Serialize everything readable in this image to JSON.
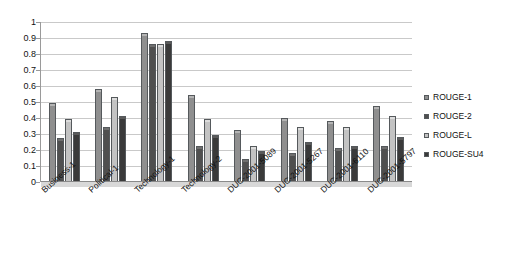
{
  "chart_data": {
    "type": "bar",
    "title": "",
    "subtitle": "",
    "xlabel": "",
    "ylabel": "",
    "ylim": [
      0,
      1
    ],
    "ytick_labels": [
      "1",
      "0.9",
      "0.8",
      "0.7",
      "0.6",
      "0.5",
      "0.4",
      "0.3",
      "0.2",
      "0.1",
      "0"
    ],
    "ytick_values": [
      1,
      0.9,
      0.8,
      0.7,
      0.6,
      0.5,
      0.4,
      0.3,
      0.2,
      0.1,
      0
    ],
    "grid": true,
    "legend_position": "right",
    "orientation": "vertical",
    "grouping": "clustered",
    "categories": [
      "Business-1",
      "Political-1",
      "Technology-1",
      "Technology-2",
      "DUC-2001-5089",
      "DUC-2001-5267",
      "DUC-2001-6110",
      "DUC-2001-5797"
    ],
    "series": [
      {
        "name": "ROUGE-1",
        "color": "#8f8f8f",
        "values": [
          0.48,
          0.57,
          0.92,
          0.53,
          0.31,
          0.39,
          0.37,
          0.46
        ]
      },
      {
        "name": "ROUGE-2",
        "color": "#4f4f4f",
        "values": [
          0.26,
          0.33,
          0.85,
          0.21,
          0.13,
          0.17,
          0.2,
          0.21
        ]
      },
      {
        "name": "ROUGE-L",
        "color": "#c3c3c3",
        "values": [
          0.38,
          0.52,
          0.85,
          0.38,
          0.21,
          0.33,
          0.33,
          0.4
        ]
      },
      {
        "name": "ROUGE-SU4",
        "color": "#3a3a3a",
        "values": [
          0.3,
          0.4,
          0.87,
          0.28,
          0.18,
          0.24,
          0.21,
          0.27
        ]
      }
    ]
  }
}
